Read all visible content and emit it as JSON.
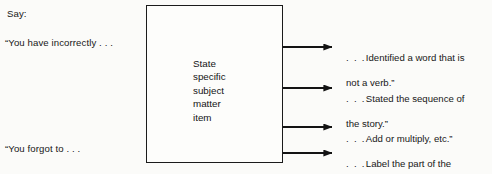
{
  "diagram": {
    "background_color": "#fbfbf9",
    "line_color": "#1b1b1b",
    "text_color": "#171717"
  },
  "left_column": {
    "say_label": "Say:",
    "prompts": [
      {
        "text": "“You have incorrectly . . ."
      },
      {
        "text": "“You forgot to . . ."
      }
    ]
  },
  "center_box": {
    "label": "State\nspecific\nsubject\nmatter\nitem",
    "lines": [
      "State",
      "specific",
      "subject",
      "matter",
      "item"
    ]
  },
  "arrows": {
    "count": 4,
    "glyph": "arrow-right-icon",
    "start_x": 283,
    "end_x": 332,
    "y_positions": [
      47,
      88,
      127,
      153
    ]
  },
  "right_column": {
    "outcomes": [
      {
        "lead": ". . .",
        "line1": "Identified a word that is",
        "line2": "not a verb.”"
      },
      {
        "lead": ". . .",
        "line1": "Stated the sequence of",
        "line2": "the story.”"
      },
      {
        "lead": ". . .",
        "line1": "Add or multiply, etc.”",
        "line2": ""
      },
      {
        "lead": ". . .",
        "line1": "Label the part of the",
        "line2": "shoulder’s bones.”"
      }
    ]
  }
}
